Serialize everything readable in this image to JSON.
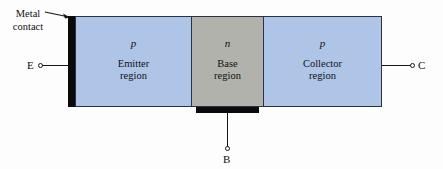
{
  "diagram": {
    "annotation": {
      "label": "Metal\ncontact",
      "arrow_icon": "arrow-right-icon"
    },
    "regions": [
      {
        "id": "emitter",
        "carrier": "p",
        "name": "Emitter\nregion",
        "color": "#aec5e8"
      },
      {
        "id": "base",
        "carrier": "n",
        "name": "Base\nregion",
        "color": "#b2b2ad"
      },
      {
        "id": "collector",
        "carrier": "p",
        "name": "Collector\nregion",
        "color": "#aec5e8"
      }
    ],
    "terminals": [
      {
        "id": "emitter",
        "label": "E"
      },
      {
        "id": "base",
        "label": "B"
      },
      {
        "id": "collector",
        "label": "C"
      }
    ],
    "contacts": {
      "color": "#0a0a0a",
      "left_name": "emitter-metal-contact",
      "right_name": "collector-metal-contact",
      "base_name": "base-metal-contact"
    },
    "colors": {
      "outline": "#2a3247",
      "lead": "#15161c",
      "background": "#fdfdfd"
    }
  }
}
